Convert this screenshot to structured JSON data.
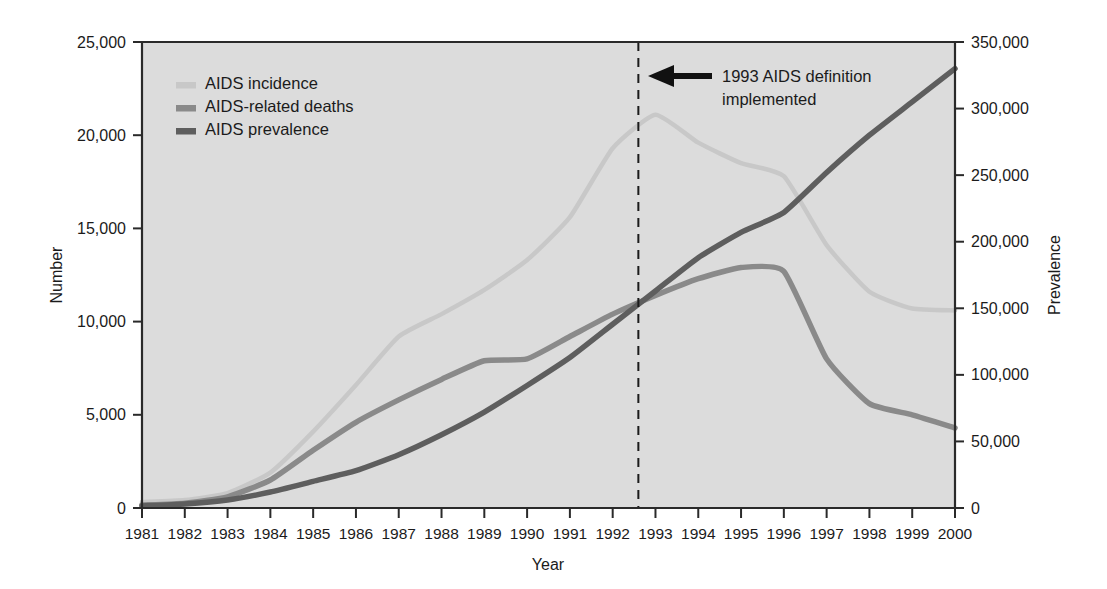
{
  "chart_data": {
    "type": "line",
    "title": "",
    "xlabel": "Year",
    "ylabel": "Number",
    "ylabel_right": "Prevalence",
    "x": [
      1981,
      1982,
      1983,
      1984,
      1985,
      1986,
      1987,
      1988,
      1989,
      1990,
      1991,
      1992,
      1993,
      1994,
      1995,
      1996,
      1997,
      1998,
      1999,
      2000
    ],
    "xlim": [
      1981,
      2000
    ],
    "ylim": [
      0,
      25000
    ],
    "ylim_right": [
      0,
      350000
    ],
    "grid": false,
    "legend_position": "upper-left-inside",
    "xtick_labels": [
      "1981",
      "1982",
      "1983",
      "1984",
      "1985",
      "1986",
      "1987",
      "1988",
      "1989",
      "1990",
      "1991",
      "1992",
      "1993",
      "1994",
      "1995",
      "1996",
      "1997",
      "1998",
      "1999",
      "2000"
    ],
    "ytick_labels_left": [
      "0",
      "5,000",
      "10,000",
      "15,000",
      "20,000",
      "25,000"
    ],
    "ytick_values_left": [
      0,
      5000,
      10000,
      15000,
      20000,
      25000
    ],
    "ytick_labels_right": [
      "0",
      "50,000",
      "100,000",
      "150,000",
      "200,000",
      "250,000",
      "300,000",
      "350,000"
    ],
    "ytick_values_right": [
      0,
      50000,
      100000,
      150000,
      200000,
      250000,
      300000,
      350000
    ],
    "series": [
      {
        "name": "AIDS incidence",
        "axis": "left",
        "color": "#c8c8c8",
        "width": 4.5,
        "values": [
          320,
          430,
          800,
          1900,
          4100,
          6600,
          9200,
          10400,
          11700,
          13300,
          15600,
          19300,
          21100,
          19600,
          18500,
          17800,
          14100,
          11600,
          10700,
          10600
        ]
      },
      {
        "name": "AIDS-related deaths",
        "axis": "left",
        "color": "#8a8a8a",
        "width": 5.5,
        "values": [
          160,
          260,
          600,
          1500,
          3100,
          4600,
          5800,
          6900,
          7900,
          8000,
          9200,
          10400,
          11400,
          12300,
          12900,
          12700,
          8000,
          5600,
          5000,
          4300
        ]
      },
      {
        "name": "AIDS prevalence",
        "axis": "right",
        "color": "#5e5e5e",
        "width": 5.5,
        "values": [
          1500,
          3000,
          6000,
          12000,
          20000,
          28000,
          40000,
          55000,
          72000,
          92000,
          113000,
          138000,
          163000,
          188000,
          207000,
          222000,
          252000,
          280000,
          305000,
          330000
        ]
      }
    ],
    "annotation": {
      "line1": "1993 AIDS definition",
      "line2": "implemented",
      "marker_x": 1992.6,
      "arrow": "left-arrow"
    }
  },
  "legend": {
    "items": [
      {
        "label": "AIDS incidence",
        "color": "#c8c8c8"
      },
      {
        "label": "AIDS-related deaths",
        "color": "#8a8a8a"
      },
      {
        "label": "AIDS prevalence",
        "color": "#5e5e5e"
      }
    ]
  },
  "colors": {
    "plot_background": "#dcdcdc",
    "page_background": "#ffffff",
    "axis": "#2a2a2a",
    "text": "#1b1b1b"
  }
}
